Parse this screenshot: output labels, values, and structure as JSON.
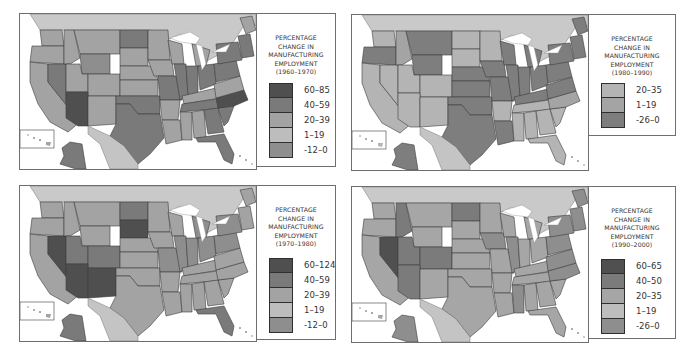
{
  "figure": {
    "panels": [
      {
        "id": "1960-1970",
        "legend": {
          "title_lines": [
            "PERCENTAGE",
            "CHANGE IN",
            "MANUFACTURING",
            "EMPLOYMENT",
            "(1960–1970)"
          ],
          "classes": [
            {
              "range": "60–85",
              "color": "#4f4f4f"
            },
            {
              "range": "40–59",
              "color": "#7a7a7a"
            },
            {
              "range": "20–39",
              "color": "#a3a3a3"
            },
            {
              "range": "1–19",
              "color": "#bdbdbd"
            },
            {
              "range": "-12–0",
              "color": "#8e8e8e"
            }
          ]
        }
      },
      {
        "id": "1980-1990",
        "legend": {
          "title_lines": [
            "PERCENTAGE",
            "CHANGE IN",
            "MANUFACTURING",
            "EMPLOYMENT",
            "(1980–1990)"
          ],
          "classes": [
            {
              "range": "20–35",
              "color": "#b4b4b4"
            },
            {
              "range": "1–19",
              "color": "#a4a4a4"
            },
            {
              "range": "-26–0",
              "color": "#7e7e7e"
            }
          ]
        }
      },
      {
        "id": "1970-1980",
        "legend": {
          "title_lines": [
            "PERCENTAGE",
            "CHANGE IN",
            "MANUFACTURING",
            "EMPLOYMENT",
            "(1970–1980)"
          ],
          "classes": [
            {
              "range": "60–124",
              "color": "#4f4f4f"
            },
            {
              "range": "40–59",
              "color": "#7a7a7a"
            },
            {
              "range": "20–39",
              "color": "#a3a3a3"
            },
            {
              "range": "1–19",
              "color": "#bdbdbd"
            },
            {
              "range": "-12–0",
              "color": "#8e8e8e"
            }
          ]
        }
      },
      {
        "id": "1990-2000",
        "legend": {
          "title_lines": [
            "PERCENTAGE",
            "CHANGE IN",
            "MANUFACTURING",
            "EMPLOYMENT",
            "(1990–2000)"
          ],
          "classes": [
            {
              "range": "60–65",
              "color": "#505050"
            },
            {
              "range": "40–50",
              "color": "#7b7b7b"
            },
            {
              "range": "20–35",
              "color": "#a6a6a6"
            },
            {
              "range": "1–19",
              "color": "#bdbdbd"
            },
            {
              "range": "-26–0",
              "color": "#8e8e8e"
            }
          ]
        }
      }
    ]
  },
  "colors": {
    "canada": "#c9c9c9",
    "mexico": "#c4c4c4",
    "water": "#ffffff",
    "border": "#3c3c3c"
  }
}
